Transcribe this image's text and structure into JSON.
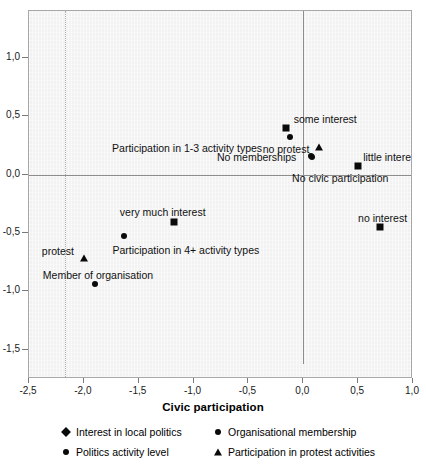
{
  "chart_data": {
    "type": "scatter",
    "title": "",
    "xlabel": "Civic participation",
    "ylabel": "",
    "xlim": [
      -2.5,
      1.0
    ],
    "ylim": [
      -1.75,
      1.4
    ],
    "grid": false,
    "legend_position": "bottom",
    "xticks": [
      {
        "value": -2.5,
        "label": "-2,5"
      },
      {
        "value": -2.0,
        "label": "-2,0"
      },
      {
        "value": -1.5,
        "label": "-1,5"
      },
      {
        "value": -1.0,
        "label": "-1,0"
      },
      {
        "value": -0.5,
        "label": "-0,5"
      },
      {
        "value": 0.0,
        "label": "0,0"
      },
      {
        "value": 0.5,
        "label": "0,5"
      },
      {
        "value": 1.0,
        "label": "1,0"
      }
    ],
    "yticks": [
      {
        "value": 1.0,
        "label": "1,0"
      },
      {
        "value": 0.5,
        "label": "0,5"
      },
      {
        "value": 0.0,
        "label": "0,0"
      },
      {
        "value": -0.5,
        "label": "-0,5"
      },
      {
        "value": -1.0,
        "label": "-1,0"
      },
      {
        "value": -1.5,
        "label": "-1,5"
      }
    ],
    "series": [
      {
        "name": "Interest in local politics",
        "marker": "diamond",
        "points": [
          {
            "label": "some interest",
            "x": -0.16,
            "y": 0.4,
            "label_dx": 8,
            "label_dy": -14,
            "label_align": "left"
          },
          {
            "label": "little interest",
            "x": 0.5,
            "y": 0.07,
            "label_dx": 5,
            "label_dy": -14,
            "label_align": "left"
          },
          {
            "label": "no interest",
            "x": 0.7,
            "y": -0.45,
            "label_dx": -22,
            "label_dy": -14,
            "label_align": "left"
          },
          {
            "label": "very much interest",
            "x": -1.18,
            "y": -0.41,
            "label_dx": -54,
            "label_dy": -15,
            "label_align": "left"
          }
        ]
      },
      {
        "name": "Politics activity level",
        "marker": "circle",
        "points": [
          {
            "label": "Participation in 1-3 activity types",
            "x": -0.12,
            "y": 0.32,
            "label_dx": -178,
            "label_dy": 6,
            "label_align": "left"
          },
          {
            "label": "Participation in 4+ activity types",
            "x": -1.63,
            "y": -0.53,
            "label_dx": -12,
            "label_dy": 9,
            "label_align": "left"
          },
          {
            "label": "No civic participation",
            "x": 0.08,
            "y": 0.15,
            "label_dx": -20,
            "label_dy": 16,
            "label_align": "left"
          }
        ]
      },
      {
        "name": "Organisational membership",
        "marker": "circle",
        "points": [
          {
            "label": "No memberships",
            "x": 0.07,
            "y": 0.16,
            "label_dx": -94,
            "label_dy": -4,
            "label_align": "left"
          },
          {
            "label": "Member of organisation",
            "x": -1.9,
            "y": -0.94,
            "label_dx": -52,
            "label_dy": -14,
            "label_align": "left"
          }
        ]
      },
      {
        "name": "Participation in protest activities",
        "marker": "triangle",
        "points": [
          {
            "label": "no protest",
            "x": 0.14,
            "y": 0.24,
            "label_dx": -56,
            "label_dy": -3,
            "label_align": "left"
          },
          {
            "label": "protest",
            "x": -2.0,
            "y": -0.71,
            "label_dx": -42,
            "label_dy": -12,
            "label_align": "left"
          }
        ]
      }
    ],
    "legend": [
      {
        "label": "Interest in local politics",
        "marker": "diamond"
      },
      {
        "label": "Organisational membership",
        "marker": "circle"
      },
      {
        "label": "Politics activity level",
        "marker": "circle"
      },
      {
        "label": "Participation in protest activities",
        "marker": "triangle"
      }
    ],
    "colors": {
      "marker": "#0a0a0a",
      "plot_background": "#f2f2f2",
      "frame": "#a8a8a8",
      "axis_line": "#8c8c8c"
    }
  }
}
